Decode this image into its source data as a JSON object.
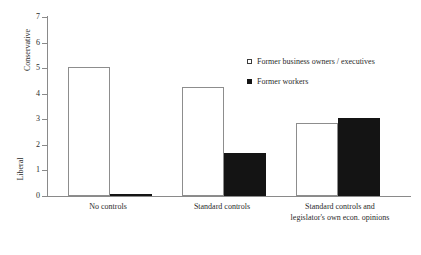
{
  "chart_data": {
    "type": "bar",
    "title": "",
    "xlabel": "",
    "ylabel": "",
    "categories": [
      "No controls",
      "Standard controls",
      "Standard controls and legislator's own econ. opinions"
    ],
    "series": [
      {
        "name": "Former business owners / executives",
        "values": [
          5.05,
          4.25,
          2.87
        ],
        "color": "#ffffff",
        "edge_color": "#8d8d8d"
      },
      {
        "name": "Former workers",
        "values": [
          0.05,
          1.7,
          3.05
        ],
        "color": "#141414",
        "edge_color": "#141414"
      }
    ],
    "ylim": [
      0,
      7
    ],
    "ytick_labels": [
      "0",
      "1",
      "2",
      "3",
      "4",
      "5",
      "6",
      "7"
    ],
    "y_axis_top_label": "Conservative",
    "y_axis_bottom_label": "Liberal",
    "grid": false,
    "legend_position": "upper right"
  },
  "axis": {
    "top_label": "Conservative",
    "bottom_label": "Liberal"
  },
  "ticks": [
    {
      "label": "7",
      "value": 7
    },
    {
      "label": "6",
      "value": 6
    },
    {
      "label": "5",
      "value": 5
    },
    {
      "label": "4",
      "value": 4
    },
    {
      "label": "3",
      "value": 3
    },
    {
      "label": "2",
      "value": 2
    },
    {
      "label": "1",
      "value": 1
    },
    {
      "label": "0",
      "value": 0
    }
  ],
  "groups": [
    {
      "label_line1": "No controls",
      "label_line2": "",
      "hollow_value": 5.05,
      "solid_value": 0.05
    },
    {
      "label_line1": "Standard controls",
      "label_line2": "",
      "hollow_value": 4.25,
      "solid_value": 1.7
    },
    {
      "label_line1": "Standard controls and",
      "label_line2": "legislator's own econ. opinions",
      "hollow_value": 2.87,
      "solid_value": 3.05
    }
  ],
  "legend": {
    "items": [
      {
        "label": "Former business owners / executives",
        "style": "hollow"
      },
      {
        "label": "Former workers",
        "style": "solid"
      }
    ]
  }
}
